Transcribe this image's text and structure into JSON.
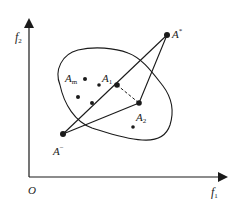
{
  "diagram": {
    "type": "multi-objective space diagram",
    "axes": {
      "origin_label": "O",
      "x_axis": {
        "label": "f",
        "subscript": "1"
      },
      "y_axis": {
        "label": "f",
        "subscript": "2"
      }
    },
    "region": {
      "description": "closed feasible region boundary"
    },
    "points": {
      "ideal": {
        "label": "A",
        "sup": "*",
        "x": 167,
        "y": 35
      },
      "anti_ideal": {
        "label": "A",
        "sup": "−",
        "x": 63,
        "y": 134
      },
      "a1": {
        "label": "A",
        "sub": "1",
        "x": 117,
        "y": 85
      },
      "a2": {
        "label": "A",
        "sub": "2",
        "x": 139,
        "y": 103
      },
      "am": {
        "label": "A",
        "sub": "m",
        "x": 85,
        "y": 79
      }
    },
    "scatter_points": [
      {
        "x": 99,
        "y": 85
      },
      {
        "x": 78,
        "y": 97
      },
      {
        "x": 92,
        "y": 103
      },
      {
        "x": 133,
        "y": 127
      }
    ],
    "connections": [
      {
        "from": "anti_ideal",
        "to": "ideal",
        "via": "a1",
        "style": "solid"
      },
      {
        "from": "anti_ideal",
        "to": "a2",
        "style": "solid"
      },
      {
        "from": "a2",
        "to": "ideal",
        "style": "solid"
      },
      {
        "from": "a1",
        "to": "a2",
        "style": "dashed"
      }
    ],
    "colors": {
      "stroke": "#1a1a1a",
      "background": "#ffffff"
    }
  }
}
